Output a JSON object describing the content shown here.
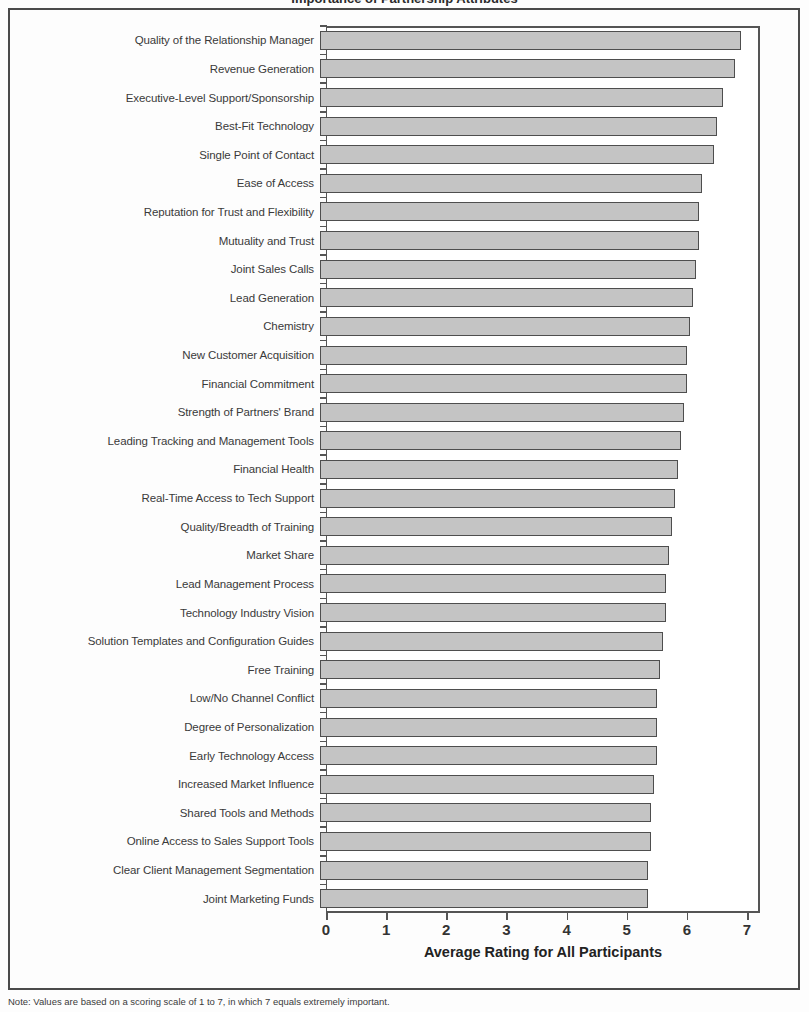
{
  "figure": {
    "title": "Importance of Partnership Attributes",
    "note": "Note: Values are based on a scoring scale of 1 to 7, in which 7 equals extremely important."
  },
  "chart_data": {
    "type": "bar",
    "orientation": "horizontal",
    "title": "Importance of Partnership Attributes",
    "xlabel": "Average Rating for All Participants",
    "ylabel": "",
    "xlim": [
      0,
      7
    ],
    "xticks": [
      0,
      1,
      2,
      3,
      4,
      5,
      6,
      7
    ],
    "grid": false,
    "legend": null,
    "bar_color": "#c4c4c4",
    "bar_edge_color": "#4e4e4e",
    "categories": [
      "Quality of the Relationship Manager",
      "Revenue Generation",
      "Executive-Level Support/Sponsorship",
      "Best-Fit Technology",
      "Single Point of Contact",
      "Ease of Access",
      "Reputation for Trust and Flexibility",
      "Mutuality and Trust",
      "Joint Sales Calls",
      "Lead Generation",
      "Chemistry",
      "New Customer Acquisition",
      "Financial Commitment",
      "Strength of Partners' Brand",
      "Leading Tracking and Management Tools",
      "Financial Health",
      "Real-Time Access to Tech Support",
      "Quality/Breadth of Training",
      "Market Share",
      "Lead Management Process",
      "Technology Industry Vision",
      "Solution Templates and Configuration Guides",
      "Free Training",
      "Low/No Channel Conflict",
      "Degree of Personalization",
      "Early Technology Access",
      "Increased Market Influence",
      "Shared Tools and Methods",
      "Online Access to Sales Support Tools",
      "Clear Client Management Segmentation",
      "Joint Marketing Funds"
    ],
    "values": [
      7.0,
      6.9,
      6.7,
      6.6,
      6.55,
      6.35,
      6.3,
      6.3,
      6.25,
      6.2,
      6.15,
      6.1,
      6.1,
      6.05,
      6.0,
      5.95,
      5.9,
      5.85,
      5.8,
      5.75,
      5.75,
      5.7,
      5.65,
      5.6,
      5.6,
      5.6,
      5.55,
      5.5,
      5.5,
      5.45,
      5.45
    ]
  }
}
